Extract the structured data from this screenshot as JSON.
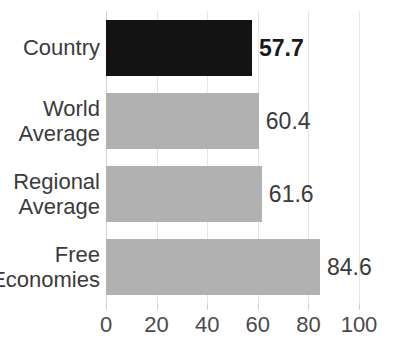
{
  "chart_data": {
    "type": "bar",
    "orientation": "horizontal",
    "title": "",
    "xlabel": "",
    "ylabel": "",
    "xlim": [
      0,
      100
    ],
    "xticks": [
      "0",
      "20",
      "40",
      "60",
      "80",
      "100"
    ],
    "grid": true,
    "legend": "none",
    "categories": [
      "Country",
      "World Average",
      "Regional Average",
      "Free Economies"
    ],
    "values": [
      57.7,
      60.4,
      61.6,
      84.6
    ],
    "bars": [
      {
        "category": "Country",
        "label_lines": [
          "Country"
        ],
        "value": 57.7,
        "value_label": "57.7",
        "color": "#131313",
        "emphasis": true
      },
      {
        "category": "World Average",
        "label_lines": [
          "World",
          "Average"
        ],
        "value": 60.4,
        "value_label": "60.4",
        "color": "#b1b1b1",
        "emphasis": false
      },
      {
        "category": "Regional Average",
        "label_lines": [
          "Regional",
          "Average"
        ],
        "value": 61.6,
        "value_label": "61.6",
        "color": "#b1b1b1",
        "emphasis": false
      },
      {
        "category": "Free Economies",
        "label_lines": [
          "Free",
          "Economies"
        ],
        "value": 84.6,
        "value_label": "84.6",
        "color": "#b1b1b1",
        "emphasis": false
      }
    ]
  },
  "colors": {
    "background": "#ffffff",
    "bar_gray": "#b1b1b1",
    "bar_black": "#131313",
    "gridline": "#e6e6e6",
    "axis": "#d2d2d2",
    "text": "#3b3b3b"
  }
}
